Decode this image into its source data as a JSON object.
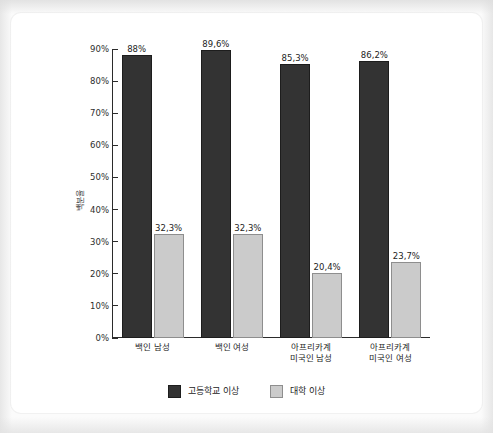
{
  "chart_data": {
    "type": "bar",
    "title": "",
    "subtitle": "",
    "xlabel": "",
    "ylabel": "백분율",
    "ylim": [
      0,
      90
    ],
    "grid": false,
    "legend_position": "bottom",
    "y_ticks": [
      "0%",
      "10%",
      "20%",
      "30%",
      "40%",
      "50%",
      "60%",
      "70%",
      "80%",
      "90%"
    ],
    "y_tick_values": [
      0,
      10,
      20,
      30,
      40,
      50,
      60,
      70,
      80,
      90
    ],
    "categories": [
      "백인 남성",
      "백인 여성",
      "아프리카계\n미국인 남성",
      "아프리카계\n미국인 여성"
    ],
    "series": [
      {
        "name": "고등학교 이상",
        "color": "#333333",
        "values": [
          88,
          89.6,
          85.3,
          86.2
        ],
        "labels": [
          "88%",
          "89,6%",
          "85,3%",
          "86,2%"
        ]
      },
      {
        "name": "대학 이상",
        "color": "#cbcbcb",
        "values": [
          32.3,
          32.3,
          20.4,
          23.7
        ],
        "labels": [
          "32,3%",
          "32,3%",
          "20,4%",
          "23,7%"
        ]
      }
    ]
  },
  "legend": {
    "items": [
      {
        "label": "고등학교 이상",
        "swatch": "high"
      },
      {
        "label": "대학 이상",
        "swatch": "college"
      }
    ]
  },
  "colors": {
    "series_high": "#333333",
    "series_college": "#cbcbcb",
    "axis": "#2b2b2b",
    "card_background": "#ffffff",
    "page_background": "#fbfbfb"
  }
}
